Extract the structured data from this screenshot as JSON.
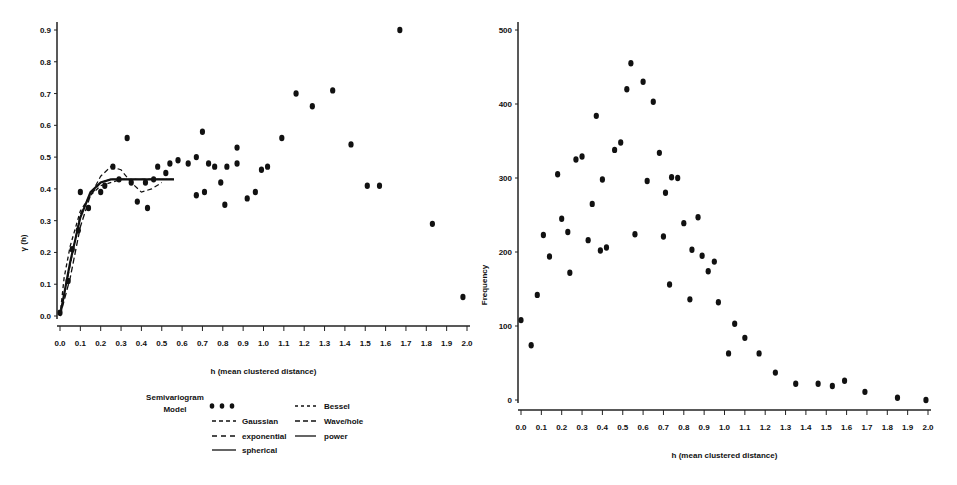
{
  "chart_data": [
    {
      "type": "scatter",
      "title": "",
      "xlabel": "h (mean clustered distance)",
      "ylabel": "γ (h)",
      "xlim": [
        0.0,
        2.0
      ],
      "ylim": [
        0.0,
        0.9
      ],
      "x_ticks": [
        "0.0",
        "0.1",
        "0.2",
        "0.3",
        "0.4",
        "0.5",
        "0.6",
        "0.7",
        "0.8",
        "0.9",
        "1.0",
        "1.1",
        "1.2",
        "1.3",
        "1.4",
        "1.5",
        "1.6",
        "1.7",
        "1.8",
        "1.9",
        "2.0"
      ],
      "y_ticks": [
        "0.0",
        "0.1",
        "0.2",
        "0.3",
        "0.4",
        "0.5",
        "0.6",
        "0.7",
        "0.8",
        "0.9"
      ],
      "grid": false,
      "legend_title": "Semivariogram Model",
      "legend": [
        {
          "label": "",
          "style": "dots"
        },
        {
          "label": "Gaussian",
          "style": "long-dash"
        },
        {
          "label": "exponential",
          "style": "dash"
        },
        {
          "label": "spherical",
          "style": "solid"
        },
        {
          "label": "Bessel",
          "style": "short-dash"
        },
        {
          "label": "Wave/hole",
          "style": "dash-dash"
        },
        {
          "label": "power",
          "style": "solid-short"
        }
      ],
      "points": {
        "x": [
          0.0,
          0.04,
          0.06,
          0.09,
          0.1,
          0.14,
          0.2,
          0.22,
          0.26,
          0.29,
          0.33,
          0.35,
          0.38,
          0.42,
          0.43,
          0.46,
          0.48,
          0.52,
          0.54,
          0.58,
          0.63,
          0.67,
          0.67,
          0.7,
          0.71,
          0.73,
          0.76,
          0.79,
          0.81,
          0.82,
          0.87,
          0.87,
          0.92,
          0.96,
          0.99,
          1.02,
          1.09,
          1.16,
          1.24,
          1.34,
          1.43,
          1.51,
          1.57,
          1.67,
          1.83,
          1.98
        ],
        "y": [
          0.01,
          0.11,
          0.21,
          0.27,
          0.39,
          0.34,
          0.39,
          0.41,
          0.47,
          0.43,
          0.56,
          0.42,
          0.36,
          0.42,
          0.34,
          0.43,
          0.47,
          0.45,
          0.48,
          0.49,
          0.48,
          0.5,
          0.38,
          0.58,
          0.39,
          0.48,
          0.47,
          0.42,
          0.35,
          0.47,
          0.48,
          0.53,
          0.37,
          0.39,
          0.46,
          0.47,
          0.56,
          0.7,
          0.66,
          0.71,
          0.54,
          0.41,
          0.41,
          0.9,
          0.29,
          0.06
        ]
      },
      "models": [
        {
          "name": "spherical",
          "x": [
            0.0,
            0.05,
            0.1,
            0.15,
            0.2,
            0.25,
            0.3,
            0.56
          ],
          "y": [
            0.0,
            0.17,
            0.31,
            0.39,
            0.42,
            0.43,
            0.43,
            0.43
          ]
        },
        {
          "name": "Gaussian",
          "x": [
            0.0,
            0.05,
            0.1,
            0.15,
            0.2,
            0.25,
            0.3,
            0.56
          ],
          "y": [
            0.0,
            0.12,
            0.28,
            0.38,
            0.42,
            0.43,
            0.43,
            0.43
          ]
        },
        {
          "name": "exponential",
          "x": [
            0.0,
            0.02,
            0.05,
            0.1,
            0.15,
            0.2,
            0.3,
            0.56
          ],
          "y": [
            0.0,
            0.12,
            0.22,
            0.33,
            0.38,
            0.41,
            0.43,
            0.43
          ]
        },
        {
          "name": "Wave/hole",
          "x": [
            0.0,
            0.1,
            0.2,
            0.25,
            0.3,
            0.35,
            0.4,
            0.45,
            0.5
          ],
          "y": [
            0.0,
            0.32,
            0.44,
            0.47,
            0.46,
            0.42,
            0.39,
            0.4,
            0.42
          ]
        }
      ]
    },
    {
      "type": "scatter",
      "title": "",
      "xlabel": "h (mean clustered distance)",
      "ylabel": "Frequency",
      "xlim": [
        0.0,
        2.0
      ],
      "ylim": [
        0,
        500
      ],
      "x_ticks": [
        "0.0",
        "0.1",
        "0.2",
        "0.3",
        "0.4",
        "0.5",
        "0.6",
        "0.7",
        "0.8",
        "0.9",
        "1.0",
        "1.1",
        "1.2",
        "1.3",
        "1.4",
        "1.5",
        "1.6",
        "1.7",
        "1.8",
        "1.9",
        "2.0"
      ],
      "y_ticks": [
        "0",
        "100",
        "200",
        "300",
        "400",
        "500"
      ],
      "grid": false,
      "points": {
        "x": [
          0.0,
          0.05,
          0.08,
          0.11,
          0.14,
          0.18,
          0.2,
          0.23,
          0.24,
          0.27,
          0.3,
          0.33,
          0.35,
          0.37,
          0.39,
          0.4,
          0.42,
          0.46,
          0.49,
          0.52,
          0.54,
          0.56,
          0.6,
          0.62,
          0.65,
          0.68,
          0.7,
          0.71,
          0.73,
          0.74,
          0.77,
          0.8,
          0.83,
          0.84,
          0.87,
          0.89,
          0.92,
          0.95,
          0.97,
          1.02,
          1.05,
          1.1,
          1.17,
          1.25,
          1.35,
          1.46,
          1.53,
          1.59,
          1.69,
          1.85,
          1.99
        ],
        "y": [
          108,
          74,
          142,
          223,
          194,
          305,
          245,
          227,
          172,
          325,
          329,
          216,
          265,
          384,
          202,
          298,
          206,
          338,
          348,
          420,
          455,
          224,
          430,
          296,
          403,
          334,
          221,
          280,
          156,
          301,
          300,
          239,
          136,
          203,
          247,
          195,
          174,
          187,
          132,
          63,
          103,
          84,
          63,
          37,
          22,
          22,
          19,
          26,
          11,
          3,
          0
        ]
      }
    }
  ]
}
